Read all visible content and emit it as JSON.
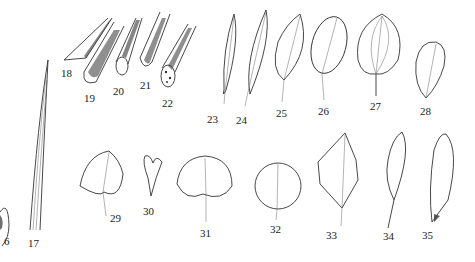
{
  "figure": {
    "type": "botanical leaf shape plate",
    "background": "#ffffff",
    "ink_color": "#222222"
  },
  "labels": [
    {
      "id": "16",
      "text": "6",
      "x": 4,
      "y": 236
    },
    {
      "id": "17",
      "text": "17",
      "x": 28,
      "y": 238
    },
    {
      "id": "18",
      "text": "18",
      "x": 61,
      "y": 68
    },
    {
      "id": "19",
      "text": "19",
      "x": 84,
      "y": 93
    },
    {
      "id": "20",
      "text": "20",
      "x": 113,
      "y": 86
    },
    {
      "id": "21",
      "text": "21",
      "x": 140,
      "y": 80
    },
    {
      "id": "22",
      "text": "22",
      "x": 162,
      "y": 98
    },
    {
      "id": "23",
      "text": "23",
      "x": 207,
      "y": 114
    },
    {
      "id": "24",
      "text": "24",
      "x": 236,
      "y": 115
    },
    {
      "id": "25",
      "text": "25",
      "x": 276,
      "y": 108
    },
    {
      "id": "26",
      "text": "26",
      "x": 318,
      "y": 106
    },
    {
      "id": "27",
      "text": "27",
      "x": 370,
      "y": 101
    },
    {
      "id": "28",
      "text": "28",
      "x": 420,
      "y": 106
    },
    {
      "id": "29",
      "text": "29",
      "x": 110,
      "y": 213
    },
    {
      "id": "30",
      "text": "30",
      "x": 143,
      "y": 206
    },
    {
      "id": "31",
      "text": "31",
      "x": 200,
      "y": 228
    },
    {
      "id": "32",
      "text": "32",
      "x": 270,
      "y": 224
    },
    {
      "id": "33",
      "text": "33",
      "x": 326,
      "y": 230
    },
    {
      "id": "34",
      "text": "34",
      "x": 383,
      "y": 231
    },
    {
      "id": "35",
      "text": "35",
      "x": 422,
      "y": 230
    }
  ]
}
